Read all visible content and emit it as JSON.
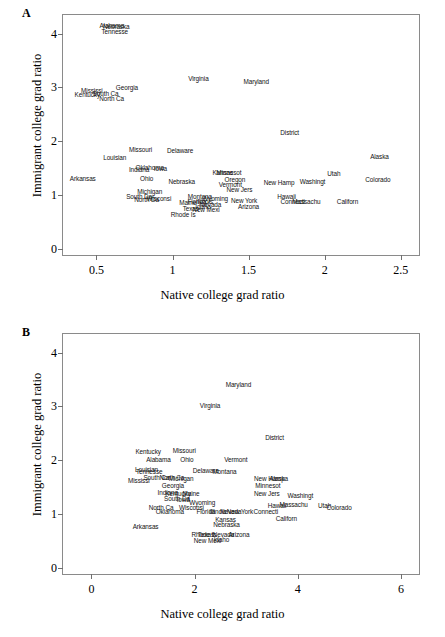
{
  "figure": {
    "panels": [
      {
        "letter": "A",
        "xlabel": "Native college grad ratio",
        "ylabel": "Immigrant college grad ratio"
      },
      {
        "letter": "B",
        "xlabel": "Native college grad ratio",
        "ylabel": "Immigrant college grad ratio"
      }
    ]
  },
  "chart_data": [
    {
      "type": "scatter",
      "panel": "A",
      "title": "",
      "xlabel": "Native college grad ratio",
      "ylabel": "Immigrant college grad ratio",
      "xlim": [
        0.28,
        2.62
      ],
      "ylim": [
        -0.12,
        4.35
      ],
      "xticks": [
        0.5,
        1,
        1.5,
        2,
        2.5
      ],
      "yticks": [
        0,
        1,
        2,
        3,
        4
      ],
      "grid": false,
      "legend": null,
      "point_style": "text-labels",
      "points": [
        {
          "label": "Alabama",
          "x": 0.6,
          "y": 4.16
        },
        {
          "label": "Nebraska",
          "x": 0.63,
          "y": 4.14
        },
        {
          "label": "Tennesse",
          "x": 0.62,
          "y": 4.06
        },
        {
          "label": "Virginia",
          "x": 1.17,
          "y": 3.18
        },
        {
          "label": "Maryland",
          "x": 1.55,
          "y": 3.12
        },
        {
          "label": "Mississi",
          "x": 0.47,
          "y": 2.96
        },
        {
          "label": "Kentucky",
          "x": 0.44,
          "y": 2.87
        },
        {
          "label": "South Ca",
          "x": 0.56,
          "y": 2.9
        },
        {
          "label": "Georgia",
          "x": 0.7,
          "y": 3.0
        },
        {
          "label": "North Ca",
          "x": 0.6,
          "y": 2.8
        },
        {
          "label": "District",
          "x": 1.77,
          "y": 2.17
        },
        {
          "label": "Missouri",
          "x": 0.79,
          "y": 1.86
        },
        {
          "label": "Delaware",
          "x": 1.05,
          "y": 1.83
        },
        {
          "label": "Alaska",
          "x": 2.36,
          "y": 1.73
        },
        {
          "label": "Louisian",
          "x": 0.62,
          "y": 1.7
        },
        {
          "label": "Indiana",
          "x": 0.78,
          "y": 1.49
        },
        {
          "label": "Oklahoma",
          "x": 0.85,
          "y": 1.52
        },
        {
          "label": "Iowa",
          "x": 0.92,
          "y": 1.5
        },
        {
          "label": "Kansas",
          "x": 1.33,
          "y": 1.43
        },
        {
          "label": "Minnesot",
          "x": 1.37,
          "y": 1.43
        },
        {
          "label": "Utah",
          "x": 2.06,
          "y": 1.41
        },
        {
          "label": "Colorado",
          "x": 2.35,
          "y": 1.29
        },
        {
          "label": "Arkansas",
          "x": 0.41,
          "y": 1.31
        },
        {
          "label": "Ohio",
          "x": 0.83,
          "y": 1.31
        },
        {
          "label": "Nebraska",
          "x": 1.06,
          "y": 1.25
        },
        {
          "label": "Oregon",
          "x": 1.41,
          "y": 1.3
        },
        {
          "label": "New Hamp",
          "x": 1.7,
          "y": 1.24
        },
        {
          "label": "Washingt",
          "x": 1.92,
          "y": 1.25
        },
        {
          "label": "Vermont",
          "x": 1.38,
          "y": 1.2
        },
        {
          "label": "Michigan",
          "x": 0.85,
          "y": 1.08
        },
        {
          "label": "New Jers",
          "x": 1.44,
          "y": 1.1
        },
        {
          "label": "South Da",
          "x": 0.78,
          "y": 0.98
        },
        {
          "label": "North Da",
          "x": 0.83,
          "y": 0.92
        },
        {
          "label": "Wisconsi",
          "x": 0.91,
          "y": 0.95
        },
        {
          "label": "Montana",
          "x": 1.18,
          "y": 0.98
        },
        {
          "label": "Wyoming",
          "x": 1.28,
          "y": 0.95
        },
        {
          "label": "New York",
          "x": 1.47,
          "y": 0.9
        },
        {
          "label": "Hawaii",
          "x": 1.75,
          "y": 0.97
        },
        {
          "label": "Connecti",
          "x": 1.79,
          "y": 0.88
        },
        {
          "label": "Massachu",
          "x": 1.88,
          "y": 0.88
        },
        {
          "label": "Californ",
          "x": 2.15,
          "y": 0.88
        },
        {
          "label": "Maine",
          "x": 1.1,
          "y": 0.86
        },
        {
          "label": "Florida",
          "x": 1.16,
          "y": 0.89
        },
        {
          "label": "Illinois",
          "x": 1.21,
          "y": 0.88
        },
        {
          "label": "Idaho",
          "x": 1.2,
          "y": 0.8
        },
        {
          "label": "Nevada",
          "x": 1.25,
          "y": 0.83
        },
        {
          "label": "Arizona",
          "x": 1.5,
          "y": 0.8
        },
        {
          "label": "Texas",
          "x": 1.12,
          "y": 0.75
        },
        {
          "label": "New Mexi",
          "x": 1.22,
          "y": 0.74
        },
        {
          "label": "Rhode Is",
          "x": 1.07,
          "y": 0.65
        }
      ]
    },
    {
      "type": "scatter",
      "panel": "B",
      "title": "",
      "xlabel": "Native college grad ratio",
      "ylabel": "Immigrant college grad ratio",
      "xlim": [
        -0.55,
        6.35
      ],
      "ylim": [
        -0.12,
        4.35
      ],
      "xticks": [
        0,
        2,
        4,
        6
      ],
      "yticks": [
        0,
        1,
        2,
        3,
        4
      ],
      "grid": false,
      "legend": null,
      "point_style": "text-labels",
      "points": [
        {
          "label": "Maryland",
          "x": 2.85,
          "y": 3.42
        },
        {
          "label": "Virginia",
          "x": 2.3,
          "y": 3.02
        },
        {
          "label": "District",
          "x": 3.55,
          "y": 2.43
        },
        {
          "label": "Kentucky",
          "x": 1.1,
          "y": 2.17
        },
        {
          "label": "Missouri",
          "x": 1.8,
          "y": 2.19
        },
        {
          "label": "Alabama",
          "x": 1.3,
          "y": 2.02
        },
        {
          "label": "Ohio",
          "x": 1.85,
          "y": 2.02
        },
        {
          "label": "Vermont",
          "x": 2.8,
          "y": 2.02
        },
        {
          "label": "Louisian",
          "x": 1.07,
          "y": 1.83
        },
        {
          "label": "Tennesse",
          "x": 1.12,
          "y": 1.79
        },
        {
          "label": "Delaware",
          "x": 2.22,
          "y": 1.82
        },
        {
          "label": "Montana",
          "x": 2.58,
          "y": 1.79
        },
        {
          "label": "South Ca",
          "x": 1.26,
          "y": 1.68
        },
        {
          "label": "North Ca",
          "x": 1.56,
          "y": 1.68
        },
        {
          "label": "Michigan",
          "x": 1.74,
          "y": 1.66
        },
        {
          "label": "Mississi",
          "x": 0.92,
          "y": 1.64
        },
        {
          "label": "New Hamp",
          "x": 3.45,
          "y": 1.66
        },
        {
          "label": "Alaska",
          "x": 3.63,
          "y": 1.66
        },
        {
          "label": "Georgia",
          "x": 1.58,
          "y": 1.54
        },
        {
          "label": "Minnesot",
          "x": 3.42,
          "y": 1.53
        },
        {
          "label": "Indiana",
          "x": 1.48,
          "y": 1.4
        },
        {
          "label": "Kentucky2",
          "x": 1.68,
          "y": 1.38
        },
        {
          "label": "Maine",
          "x": 1.93,
          "y": 1.38
        },
        {
          "label": "New Jers",
          "x": 3.4,
          "y": 1.38
        },
        {
          "label": "South Da",
          "x": 1.66,
          "y": 1.3
        },
        {
          "label": "Iowa",
          "x": 1.78,
          "y": 1.28
        },
        {
          "label": "Washingt",
          "x": 4.05,
          "y": 1.36
        },
        {
          "label": "Wyoming",
          "x": 2.15,
          "y": 1.22
        },
        {
          "label": "North Ca2",
          "x": 1.35,
          "y": 1.12
        },
        {
          "label": "Wisconsi",
          "x": 1.94,
          "y": 1.12
        },
        {
          "label": "Hawaii",
          "x": 3.6,
          "y": 1.16
        },
        {
          "label": "Massachu",
          "x": 3.92,
          "y": 1.18
        },
        {
          "label": "Utah",
          "x": 4.52,
          "y": 1.16
        },
        {
          "label": "Colorado",
          "x": 4.8,
          "y": 1.13
        },
        {
          "label": "Oklahoma",
          "x": 1.52,
          "y": 1.05
        },
        {
          "label": "Florida",
          "x": 2.22,
          "y": 1.05
        },
        {
          "label": "Illinois",
          "x": 2.45,
          "y": 1.06
        },
        {
          "label": "Nevada",
          "x": 2.7,
          "y": 1.06
        },
        {
          "label": "New York",
          "x": 2.88,
          "y": 1.06
        },
        {
          "label": "Connecti",
          "x": 3.38,
          "y": 1.05
        },
        {
          "label": "Californ",
          "x": 3.78,
          "y": 0.92
        },
        {
          "label": "Kansas",
          "x": 2.6,
          "y": 0.9
        },
        {
          "label": "Nebraska",
          "x": 2.62,
          "y": 0.82
        },
        {
          "label": "Arkansas",
          "x": 1.05,
          "y": 0.78
        },
        {
          "label": "Rhode Is",
          "x": 2.18,
          "y": 0.62
        },
        {
          "label": "Texas",
          "x": 2.22,
          "y": 0.62
        },
        {
          "label": "Nevada2",
          "x": 2.56,
          "y": 0.62
        },
        {
          "label": "Arizona",
          "x": 2.86,
          "y": 0.62
        },
        {
          "label": "New Mexi",
          "x": 2.25,
          "y": 0.52
        },
        {
          "label": "Idaho",
          "x": 2.52,
          "y": 0.54
        }
      ]
    }
  ]
}
